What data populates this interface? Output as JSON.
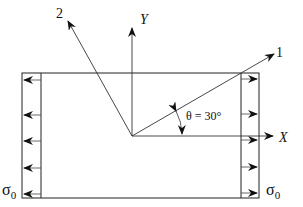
{
  "diagram": {
    "axes": {
      "x_label": "X",
      "y_label": "Y",
      "axis1_label": "1",
      "axis2_label": "2"
    },
    "angle": {
      "symbol": "θ",
      "text": "θ = 30°",
      "value_deg": 30
    },
    "stress": {
      "left_label": "σ",
      "left_subscript": "0",
      "right_label": "σ",
      "right_subscript": "0"
    },
    "colors": {
      "stroke": "#222222",
      "background": "#ffffff"
    }
  }
}
